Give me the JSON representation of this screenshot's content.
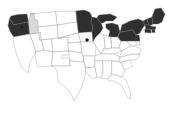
{
  "figure": {
    "kind": "choropleth-map",
    "region": "United States",
    "background_color": "#ffffff",
    "border_color": "#9a9a9a",
    "highlight_color": "#2f2f2f",
    "unhighlighted_color": "#ffffff",
    "hatch_color": "#b9b9b9",
    "marker_color": "#1a1a1a",
    "title": "",
    "legend": [],
    "labels": []
  },
  "chart_data": {
    "type": "map",
    "title": "",
    "states": [
      {
        "code": "WA",
        "name": "Washington",
        "highlighted": true,
        "fill": "#2f2f2f"
      },
      {
        "code": "OR",
        "name": "Oregon",
        "highlighted": true,
        "fill": "#2f2f2f"
      },
      {
        "code": "CA",
        "name": "California",
        "highlighted": false,
        "fill": "#ffffff"
      },
      {
        "code": "NV",
        "name": "Nevada",
        "highlighted": false,
        "fill": "#ffffff"
      },
      {
        "code": "ID",
        "name": "Idaho",
        "highlighted": false,
        "fill": "#d9d9d9"
      },
      {
        "code": "MT",
        "name": "Montana",
        "highlighted": false,
        "fill": "#ffffff"
      },
      {
        "code": "WY",
        "name": "Wyoming",
        "highlighted": false,
        "fill": "#ffffff"
      },
      {
        "code": "UT",
        "name": "Utah",
        "highlighted": false,
        "fill": "#ffffff"
      },
      {
        "code": "AZ",
        "name": "Arizona",
        "highlighted": false,
        "fill": "#ffffff"
      },
      {
        "code": "CO",
        "name": "Colorado",
        "highlighted": false,
        "fill": "#ffffff"
      },
      {
        "code": "NM",
        "name": "New Mexico",
        "highlighted": false,
        "fill": "#ffffff"
      },
      {
        "code": "ND",
        "name": "North Dakota",
        "highlighted": false,
        "fill": "#ffffff"
      },
      {
        "code": "SD",
        "name": "South Dakota",
        "highlighted": false,
        "fill": "#ffffff"
      },
      {
        "code": "NE",
        "name": "Nebraska",
        "highlighted": false,
        "fill": "#ffffff"
      },
      {
        "code": "KS",
        "name": "Kansas",
        "highlighted": false,
        "fill": "#ffffff"
      },
      {
        "code": "OK",
        "name": "Oklahoma",
        "highlighted": false,
        "fill": "#ffffff"
      },
      {
        "code": "TX",
        "name": "Texas",
        "highlighted": false,
        "fill": "#ffffff"
      },
      {
        "code": "MN",
        "name": "Minnesota",
        "highlighted": true,
        "fill": "#2f2f2f"
      },
      {
        "code": "IA",
        "name": "Iowa",
        "highlighted": false,
        "fill": "#ffffff"
      },
      {
        "code": "MO",
        "name": "Missouri",
        "highlighted": false,
        "fill": "#ffffff"
      },
      {
        "code": "AR",
        "name": "Arkansas",
        "highlighted": false,
        "fill": "#ffffff"
      },
      {
        "code": "LA",
        "name": "Louisiana",
        "highlighted": false,
        "fill": "#ffffff"
      },
      {
        "code": "WI",
        "name": "Wisconsin",
        "highlighted": true,
        "fill": "#2f2f2f"
      },
      {
        "code": "MI",
        "name": "Michigan",
        "highlighted": true,
        "fill": "#2f2f2f"
      },
      {
        "code": "IL",
        "name": "Illinois",
        "highlighted": false,
        "fill": "#ffffff"
      },
      {
        "code": "IN",
        "name": "Indiana",
        "highlighted": false,
        "fill": "#ffffff"
      },
      {
        "code": "OH",
        "name": "Ohio",
        "highlighted": false,
        "fill": "#ffffff"
      },
      {
        "code": "KY",
        "name": "Kentucky",
        "highlighted": false,
        "fill": "#ffffff"
      },
      {
        "code": "TN",
        "name": "Tennessee",
        "highlighted": false,
        "fill": "#ffffff"
      },
      {
        "code": "MS",
        "name": "Mississippi",
        "highlighted": false,
        "fill": "#ffffff"
      },
      {
        "code": "AL",
        "name": "Alabama",
        "highlighted": false,
        "fill": "#ffffff"
      },
      {
        "code": "GA",
        "name": "Georgia",
        "highlighted": false,
        "fill": "#ffffff"
      },
      {
        "code": "FL",
        "name": "Florida",
        "highlighted": false,
        "fill": "#ffffff"
      },
      {
        "code": "SC",
        "name": "South Carolina",
        "highlighted": false,
        "fill": "#ffffff"
      },
      {
        "code": "NC",
        "name": "North Carolina",
        "highlighted": false,
        "fill": "#ffffff"
      },
      {
        "code": "VA",
        "name": "Virginia",
        "highlighted": false,
        "fill": "#ffffff"
      },
      {
        "code": "WV",
        "name": "West Virginia",
        "highlighted": false,
        "fill": "#ffffff"
      },
      {
        "code": "MD",
        "name": "Maryland",
        "highlighted": false,
        "fill": "#ffffff"
      },
      {
        "code": "DE",
        "name": "Delaware",
        "highlighted": false,
        "fill": "#ffffff"
      },
      {
        "code": "NJ",
        "name": "New Jersey",
        "highlighted": true,
        "fill": "#2f2f2f"
      },
      {
        "code": "PA",
        "name": "Pennsylvania",
        "highlighted": true,
        "fill": "#2f2f2f"
      },
      {
        "code": "NY",
        "name": "New York",
        "highlighted": true,
        "fill": "#2f2f2f"
      },
      {
        "code": "CT",
        "name": "Connecticut",
        "highlighted": true,
        "fill": "#2f2f2f"
      },
      {
        "code": "RI",
        "name": "Rhode Island",
        "highlighted": true,
        "fill": "#2f2f2f"
      },
      {
        "code": "MA",
        "name": "Massachusetts",
        "highlighted": true,
        "fill": "#2f2f2f"
      },
      {
        "code": "VT",
        "name": "Vermont",
        "highlighted": true,
        "fill": "#2f2f2f"
      },
      {
        "code": "NH",
        "name": "New Hampshire",
        "highlighted": true,
        "fill": "#2f2f2f"
      },
      {
        "code": "ME",
        "name": "Maine",
        "highlighted": true,
        "fill": "#2f2f2f"
      }
    ],
    "markers": [
      {
        "label": "",
        "x": 22,
        "y": 27,
        "r": 1.6,
        "color": "#1a1a1a"
      },
      {
        "label": "",
        "x": 87,
        "y": 40,
        "r": 1.7,
        "color": "#1a1a1a"
      }
    ],
    "highlighted_count": 13,
    "total_states": 48
  }
}
